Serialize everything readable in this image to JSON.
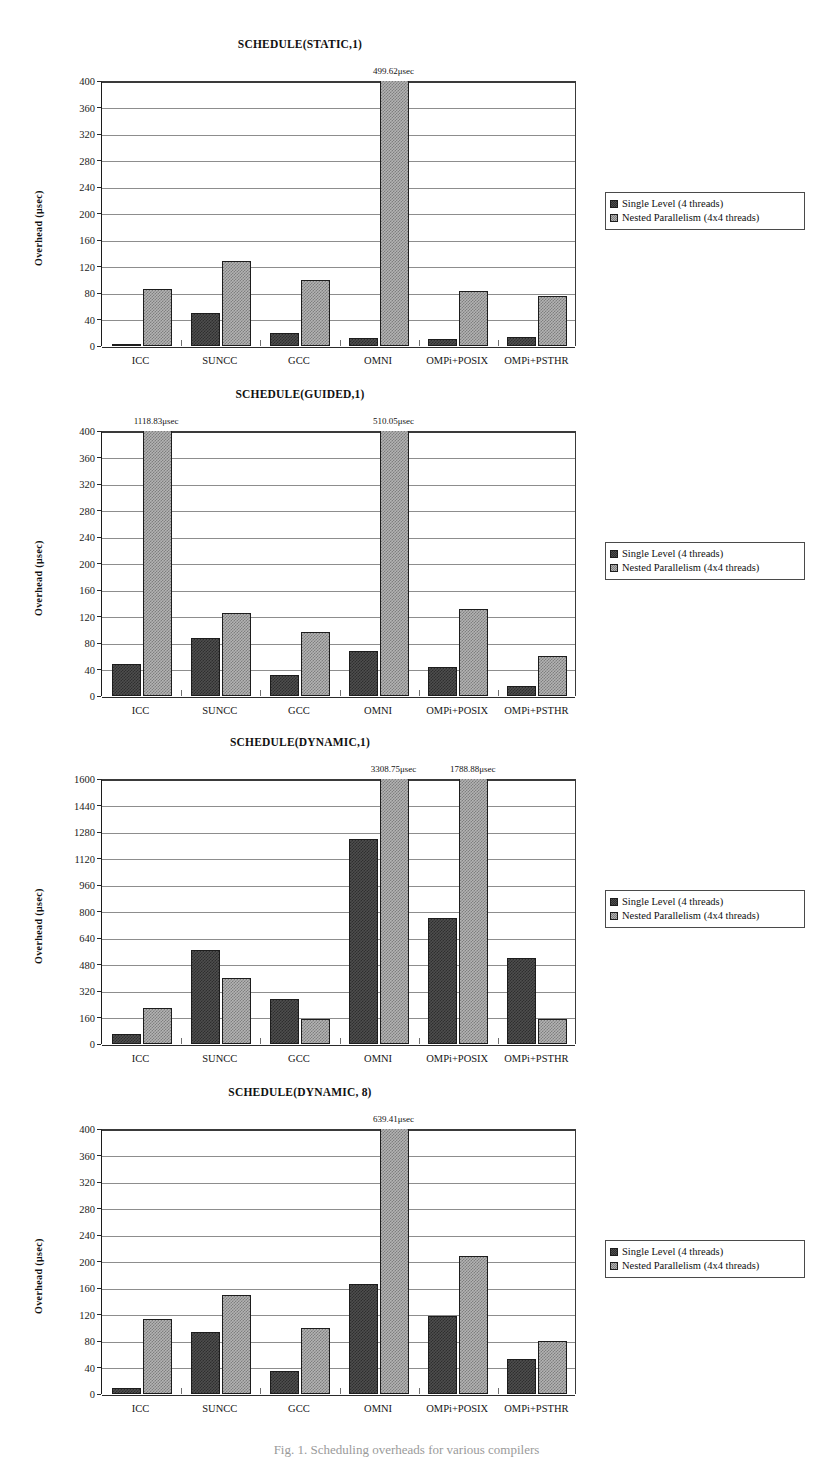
{
  "figure": {
    "caption": "Fig. 1. Scheduling overheads for various compilers"
  },
  "legend": {
    "position": "right",
    "entries": [
      {
        "label": "Single Level (4 threads)",
        "color": "#4e4e4e"
      },
      {
        "label": "Nested Parallelism (4x4 threads)",
        "color": "#b3b3b3"
      }
    ]
  },
  "axis": {
    "ylabel": "Overhead  (μsec)"
  },
  "chart_data": [
    {
      "type": "bar",
      "title": "SCHEDULE(STATIC,1)",
      "xlabel": "",
      "ylabel": "Overhead  (μsec)",
      "ylim": [
        0,
        400
      ],
      "ytick_step": 40,
      "yticks": [
        "0",
        "40",
        "80",
        "120",
        "160",
        "200",
        "240",
        "280",
        "320",
        "360",
        "400"
      ],
      "grid": true,
      "legend_position": "right",
      "categories": [
        "ICC",
        "SUNCC",
        "GCC",
        "OMNI",
        "OMPi+POSIX",
        "OMPi+PSTHR"
      ],
      "series": [
        {
          "name": "Single Level (4 threads)",
          "values": [
            2,
            50,
            20,
            12,
            10,
            13
          ]
        },
        {
          "name": "Nested Parallelism (4x4 threads)",
          "values": [
            86,
            129,
            100,
            499.62,
            83,
            76
          ]
        }
      ],
      "annotations": [
        {
          "category": "OMNI",
          "series": "Nested Parallelism (4x4 threads)",
          "text": "499.62μsec",
          "value": 499.62
        }
      ]
    },
    {
      "type": "bar",
      "title": "SCHEDULE(GUIDED,1)",
      "xlabel": "",
      "ylabel": "Overhead  (μsec)",
      "ylim": [
        0,
        400
      ],
      "ytick_step": 40,
      "yticks": [
        "0",
        "40",
        "80",
        "120",
        "160",
        "200",
        "240",
        "280",
        "320",
        "360",
        "400"
      ],
      "grid": true,
      "legend_position": "right",
      "categories": [
        "ICC",
        "SUNCC",
        "GCC",
        "OMNI",
        "OMPi+POSIX",
        "OMPi+PSTHR"
      ],
      "series": [
        {
          "name": "Single Level (4 threads)",
          "values": [
            48,
            88,
            32,
            68,
            44,
            15
          ]
        },
        {
          "name": "Nested Parallelism (4x4 threads)",
          "values": [
            1118.83,
            125,
            96,
            510.05,
            131,
            61
          ]
        }
      ],
      "annotations": [
        {
          "category": "ICC",
          "series": "Nested Parallelism (4x4 threads)",
          "text": "1118.83μsec",
          "value": 1118.83
        },
        {
          "category": "OMNI",
          "series": "Nested Parallelism (4x4 threads)",
          "text": "510.05μsec",
          "value": 510.05
        }
      ]
    },
    {
      "type": "bar",
      "title": "SCHEDULE(DYNAMIC,1)",
      "xlabel": "",
      "ylabel": "Overhead  (μsec)",
      "ylim": [
        0,
        1600
      ],
      "ytick_step": 160,
      "yticks": [
        "0",
        "160",
        "320",
        "480",
        "640",
        "800",
        "960",
        "1120",
        "1280",
        "1440",
        "1600"
      ],
      "grid": true,
      "legend_position": "right",
      "categories": [
        "ICC",
        "SUNCC",
        "GCC",
        "OMNI",
        "OMPi+POSIX",
        "OMPi+PSTHR"
      ],
      "series": [
        {
          "name": "Single Level (4 threads)",
          "values": [
            60,
            570,
            270,
            1235,
            760,
            520
          ]
        },
        {
          "name": "Nested Parallelism (4x4 threads)",
          "values": [
            215,
            400,
            150,
            3308.75,
            1788.88,
            150
          ]
        }
      ],
      "annotations": [
        {
          "category": "OMNI",
          "series": "Nested Parallelism (4x4 threads)",
          "text": "3308.75μsec",
          "value": 3308.75
        },
        {
          "category": "OMPi+POSIX",
          "series": "Nested Parallelism (4x4 threads)",
          "text": "1788.88μsec",
          "value": 1788.88
        }
      ]
    },
    {
      "type": "bar",
      "title": "SCHEDULE(DYNAMIC, 8)",
      "xlabel": "",
      "ylabel": "Overhead  (μsec)",
      "ylim": [
        0,
        400
      ],
      "ytick_step": 40,
      "yticks": [
        "0",
        "40",
        "80",
        "120",
        "160",
        "200",
        "240",
        "280",
        "320",
        "360",
        "400"
      ],
      "grid": true,
      "legend_position": "right",
      "categories": [
        "ICC",
        "SUNCC",
        "GCC",
        "OMNI",
        "OMPi+POSIX",
        "OMPi+PSTHR"
      ],
      "series": [
        {
          "name": "Single Level (4 threads)",
          "values": [
            9,
            94,
            34,
            166,
            118,
            53
          ]
        },
        {
          "name": "Nested Parallelism (4x4 threads)",
          "values": [
            113,
            150,
            100,
            639.41,
            209,
            80
          ]
        }
      ],
      "annotations": [
        {
          "category": "OMNI",
          "series": "Nested Parallelism (4x4 threads)",
          "text": "639.41μsec",
          "value": 639.41
        }
      ]
    }
  ]
}
